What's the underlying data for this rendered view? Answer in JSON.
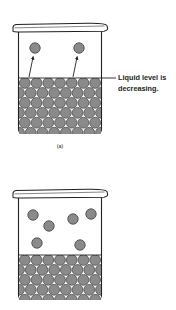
{
  "figure": {
    "background_color": "#ffffff",
    "width": 176,
    "height": 310
  },
  "colors": {
    "molecule_fill": "#8a8a8a",
    "molecule_stroke": "#4d4d4d",
    "container_stroke": "#231f20",
    "container_fill": "#ffffff",
    "text": "#231f20",
    "arrow": "#231f20"
  },
  "annotation": {
    "line1": "Liquid level is",
    "line2": "decreasing.",
    "leader_label": "leader-line"
  },
  "panels": [
    {
      "id": "a",
      "caption": "(a)",
      "beaker": {
        "left": 18,
        "right": 102,
        "top": 30,
        "bottom": 134,
        "rim_top": 24
      },
      "liquid": {
        "level_y": 78,
        "rows": 6,
        "columns": 7,
        "molecule_radius": 5.4,
        "description": "densely packed liquid molecules"
      },
      "vapor_molecules": [
        {
          "cx": 35,
          "cy": 48,
          "r": 5.2
        },
        {
          "cx": 79,
          "cy": 48,
          "r": 5.2
        }
      ],
      "arrows": [
        {
          "x1": 29,
          "y1": 77,
          "x2": 33,
          "y2": 56
        },
        {
          "x1": 73,
          "y1": 77,
          "x2": 77,
          "y2": 56
        }
      ]
    },
    {
      "id": "b",
      "caption": "",
      "beaker": {
        "left": 18,
        "right": 102,
        "top": 196,
        "bottom": 300,
        "rim_top": 190
      },
      "liquid": {
        "level_y": 255,
        "rows": 5,
        "columns": 7,
        "molecule_radius": 5.4,
        "description": "densely packed liquid molecules at lower level"
      },
      "vapor_molecules": [
        {
          "cx": 33,
          "cy": 215,
          "r": 5.2
        },
        {
          "cx": 49,
          "cy": 226,
          "r": 5.2
        },
        {
          "cx": 73,
          "cy": 219,
          "r": 5.2
        },
        {
          "cx": 91,
          "cy": 214,
          "r": 5.2
        },
        {
          "cx": 37,
          "cy": 243,
          "r": 5.2
        },
        {
          "cx": 80,
          "cy": 245,
          "r": 5.2
        }
      ],
      "arrows": []
    }
  ]
}
